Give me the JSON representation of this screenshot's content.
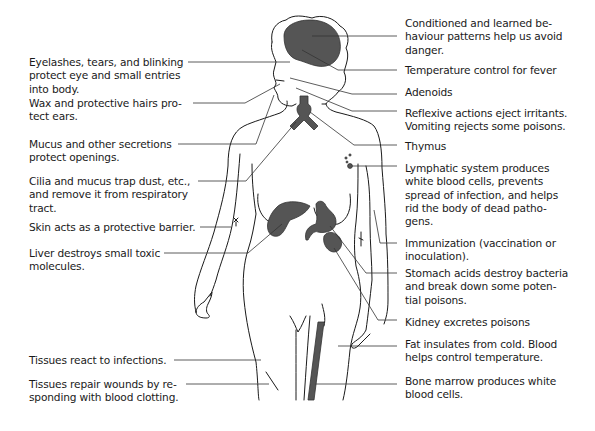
{
  "figure": {
    "colors": {
      "organ_fill": "#555555",
      "outline": "#1a1a1a",
      "leader": "#333333",
      "background": "#ffffff"
    }
  },
  "labels_left": [
    {
      "id": "eyelashes",
      "text": "Eyelashes, tears, and blinking\nprotect eye and small entries\ninto body."
    },
    {
      "id": "wax",
      "text": "Wax and protective hairs pro-\ntect ears."
    },
    {
      "id": "mucus",
      "text": "Mucus and other secretions\nprotect openings."
    },
    {
      "id": "cilia",
      "text": "Cilia and mucus trap dust, etc.,\nand remove it from respiratory\ntract."
    },
    {
      "id": "skin",
      "text": "Skin acts as a protective barrier."
    },
    {
      "id": "liver",
      "text": "Liver destroys small toxic\nmolecules."
    },
    {
      "id": "tissues-react",
      "text": "Tissues react to infections."
    },
    {
      "id": "tissues-repair",
      "text": "Tissues repair wounds by re-\nsponding with blood clotting."
    }
  ],
  "labels_right": [
    {
      "id": "conditioned",
      "text": "Conditioned and learned be-\nhaviour patterns help us avoid\ndanger."
    },
    {
      "id": "temperature",
      "text": "Temperature control for fever"
    },
    {
      "id": "adenoids",
      "text": "Adenoids"
    },
    {
      "id": "reflexive",
      "text": "Reflexive actions eject irritants.\nVomiting rejects some poisons."
    },
    {
      "id": "thymus",
      "text": "Thymus"
    },
    {
      "id": "lymphatic",
      "text": "Lymphatic system produces\nwhite blood cells, prevents\nspread of infection, and helps\nrid the body of dead patho-\ngens."
    },
    {
      "id": "immunization",
      "text": "Immunization (vaccination or\ninoculation)."
    },
    {
      "id": "stomach",
      "text": "Stomach acids destroy bacteria\nand break down some poten-\ntial poisons."
    },
    {
      "id": "kidney",
      "text": "Kidney excretes poisons"
    },
    {
      "id": "fat",
      "text": "Fat insulates from cold. Blood\nhelps control temperature."
    },
    {
      "id": "bone-marrow",
      "text": "Bone marrow produces white\nblood cells."
    }
  ]
}
